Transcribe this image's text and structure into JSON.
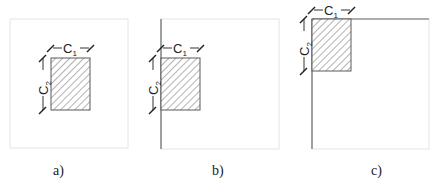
{
  "figure": {
    "panels": [
      {
        "id": "a",
        "caption": "a)",
        "description": "Interior column",
        "dim1": "C",
        "dim1_sub": "1",
        "dim2": "C",
        "dim2_sub": "2"
      },
      {
        "id": "b",
        "caption": "b)",
        "description": "Edge column",
        "dim1": "C",
        "dim1_sub": "1",
        "dim2": "C",
        "dim2_sub": "2"
      },
      {
        "id": "c",
        "caption": "c)",
        "description": "Corner column",
        "dim1": "C",
        "dim1_sub": "1",
        "dim2": "C",
        "dim2_sub": "2"
      }
    ],
    "colors": {
      "hatch": "#555555",
      "frame": "#e4e4e4",
      "edge_line": "#6a6a6a"
    }
  }
}
